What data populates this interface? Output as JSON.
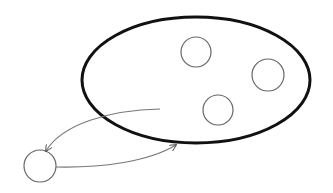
{
  "canvas": {
    "width": 333,
    "height": 193,
    "background": "#ffffff"
  },
  "colors": {
    "set_stroke": "#111111",
    "element_stroke": "#666666",
    "arrow_stroke": "#777777"
  },
  "set": {
    "label": "",
    "cx": 196,
    "cy": 80,
    "rx": 114,
    "ry": 63,
    "stroke_width": 3
  },
  "members": [
    {
      "label": "",
      "cx": 196,
      "cy": 52,
      "r": 15
    },
    {
      "label": "",
      "cx": 268,
      "cy": 75,
      "r": 16
    },
    {
      "label": "",
      "cx": 218,
      "cy": 110,
      "r": 15
    }
  ],
  "outside_element": {
    "label": "",
    "cx": 40,
    "cy": 166,
    "r": 16
  },
  "arrows": [
    {
      "label": "",
      "from": "set-interior",
      "to": "outside-element",
      "path": "M160,109 C110,110 62,124 46,151"
    },
    {
      "label": "",
      "from": "outside-element",
      "to": "set-boundary",
      "path": "M56,167 C100,168 148,162 176,145"
    }
  ]
}
